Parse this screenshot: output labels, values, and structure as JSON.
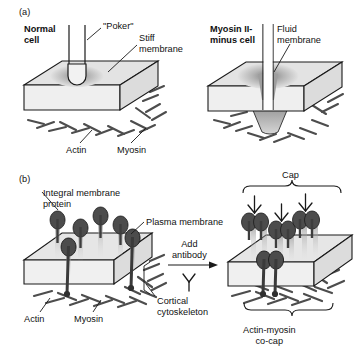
{
  "figure": {
    "panels": [
      {
        "id": "(a)",
        "labels": {
          "normal_cell": "Normal\ncell",
          "poker": "\"Poker\"",
          "stiff_membrane": "Stiff\nmembrane",
          "myosin_minus_cell": "Myosin II-\nminus cell",
          "fluid_membrane": "Fluid\nmembrane",
          "actin": "Actin",
          "myosin": "Myosin"
        }
      },
      {
        "id": "(b)",
        "labels": {
          "integral_membrane_protein": "Integral membrane\nprotein",
          "plasma_membrane": "Plasma membrane",
          "add_antibody": "Add\nantibody",
          "cortical_cytoskeleton": "Cortical\ncytoskeleton",
          "actin": "Actin",
          "myosin": "Myosin",
          "cap": "Cap",
          "actin_myosin_cocap": "Actin-myosin\nco-cap"
        }
      }
    ],
    "icons": {
      "antibody": "antibody-y-glyph",
      "arrow": "right-arrow",
      "brace_top": "curly-brace-down",
      "brace_bottom": "curly-brace-up"
    },
    "colors": {
      "outline": "#1a1a1a",
      "slab_top": "#e3e3e3",
      "slab_front": "#ededed",
      "slab_side": "#d8d8d8",
      "protein": "#4a4a4a",
      "filament": "#555555",
      "background": "#ffffff"
    }
  }
}
